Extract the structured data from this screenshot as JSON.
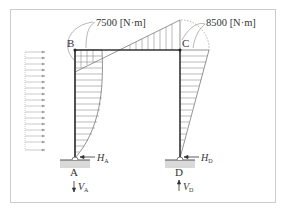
{
  "diagram": {
    "type": "bending-moment-diagram-portal-frame",
    "nodes": {
      "B": "B",
      "C": "C",
      "A": "A",
      "D": "D"
    },
    "moments": {
      "at_B": "7500 [N·m]",
      "at_C": "8500 [N·m]"
    },
    "reactions": {
      "HA_base": "H",
      "HA_sub": "A",
      "VA_base": "V",
      "VA_sub": "A",
      "HD_base": "H",
      "HD_sub": "D",
      "VD_base": "V",
      "VD_sub": "D"
    },
    "colors": {
      "frame": "#333333",
      "border": "#cccccc",
      "hatch": "#555555",
      "ground": "#d9d9d9",
      "load": "#aaaaaa"
    }
  }
}
